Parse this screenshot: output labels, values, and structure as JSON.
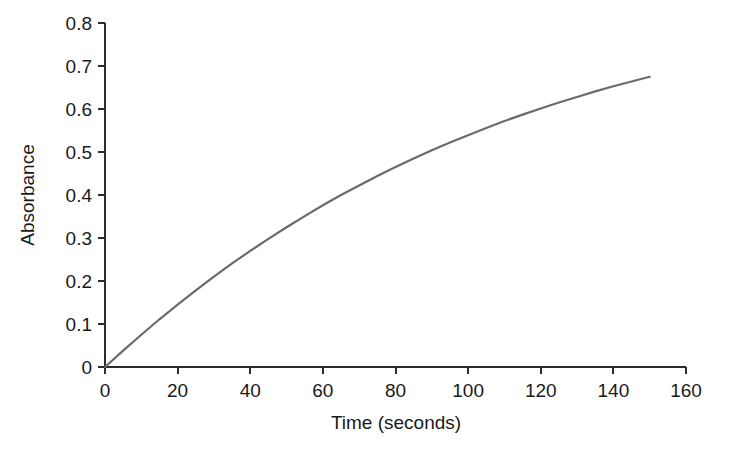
{
  "figure": {
    "background_color": "#ffffff",
    "axis_color": "#2b2b2b",
    "text_color": "#1a1a1a"
  },
  "chart_data": {
    "type": "line",
    "title": "",
    "subtitle": "",
    "xlabel": "Time (seconds)",
    "ylabel": "Absorbance",
    "xlim": [
      0,
      160
    ],
    "ylim": [
      0,
      0.8
    ],
    "xticks": [
      0,
      20,
      40,
      60,
      80,
      100,
      120,
      140,
      160
    ],
    "xticklabels": [
      "0",
      "20",
      "40",
      "60",
      "80",
      "100",
      "120",
      "140",
      "160"
    ],
    "yticks": [
      0,
      0.1,
      0.2,
      0.3,
      0.4,
      0.5,
      0.6,
      0.7,
      0.8
    ],
    "yticklabels": [
      "0",
      "0.1",
      "0.2",
      "0.3",
      "0.4",
      "0.5",
      "0.6",
      "0.7",
      "0.8"
    ],
    "grid": false,
    "legend": false,
    "legend_position": "none",
    "series": [
      {
        "name": "Absorbance vs time",
        "color": "#6b6b6b",
        "line_width": 2.2,
        "x": [
          0,
          5,
          10,
          15,
          20,
          25,
          30,
          35,
          40,
          45,
          50,
          55,
          60,
          65,
          70,
          75,
          80,
          85,
          90,
          95,
          100,
          105,
          110,
          115,
          120,
          125,
          130,
          135,
          140,
          145,
          150
        ],
        "y": [
          0.0,
          0.038,
          0.075,
          0.111,
          0.145,
          0.178,
          0.21,
          0.241,
          0.27,
          0.298,
          0.325,
          0.351,
          0.376,
          0.4,
          0.422,
          0.444,
          0.465,
          0.485,
          0.504,
          0.522,
          0.539,
          0.556,
          0.572,
          0.587,
          0.601,
          0.615,
          0.628,
          0.641,
          0.653,
          0.664,
          0.675
        ]
      }
    ],
    "annotations": []
  },
  "axis_labels": {
    "x_title": "Time (seconds)",
    "y_title": "Absorbance"
  }
}
